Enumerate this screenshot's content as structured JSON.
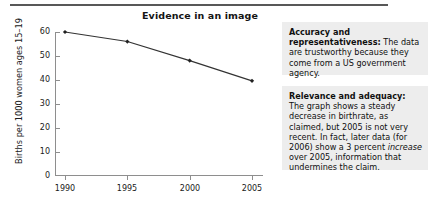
{
  "figure": {
    "title": "Evidence in an image"
  },
  "chart_data": {
    "type": "line",
    "title": "Evidence in an image",
    "xlabel": "",
    "ylabel": "Births per 1000 women ages 15–19",
    "categories": [
      "1990",
      "1995",
      "2000",
      "2005"
    ],
    "x": [
      1990,
      1995,
      2000,
      2005
    ],
    "values": [
      60,
      56,
      48,
      39.5
    ],
    "series": [
      {
        "name": "Births per 1000 women ages 15-19",
        "values": [
          60,
          56,
          48,
          39.5
        ]
      }
    ],
    "ylim": [
      0,
      60
    ],
    "xlim": [
      1990,
      2005
    ],
    "yticks": [
      "0",
      "10",
      "20",
      "30",
      "40",
      "50",
      "60"
    ],
    "ytick_values": [
      0,
      10,
      20,
      30,
      40,
      50,
      60
    ],
    "xticks": [
      "1990",
      "1995",
      "2000",
      "2005"
    ],
    "grid": false,
    "legend": "none",
    "line_color": "#333333",
    "marker": "diamond",
    "marker_color": "#222222"
  },
  "notes": [
    {
      "id": "accuracy",
      "lead": "Accuracy and representativeness:",
      "body": " The data are trustworthy because they come from a US government agency."
    },
    {
      "id": "relevance",
      "lead": "Relevance and adequacy:",
      "body_1": " The graph shows a steady decrease in birthrate, as claimed, but 2005 is not very recent. In fact, later data (for 2006) show a 3 percent ",
      "emphasis": "increase",
      "body_2": " over 2005, information that undermines the claim."
    }
  ]
}
